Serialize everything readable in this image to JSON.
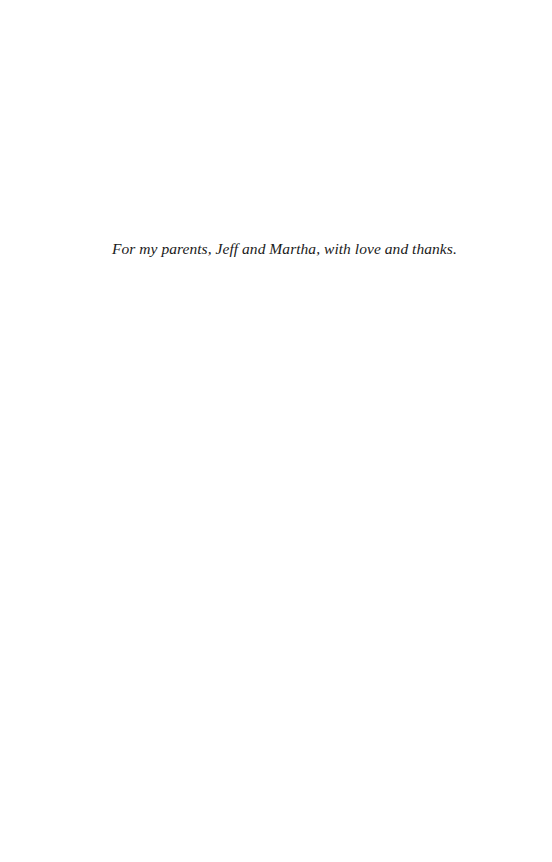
{
  "page": {
    "background": "#ffffff",
    "dedication": "For my parents, Jeff and Martha, with love and thanks."
  }
}
